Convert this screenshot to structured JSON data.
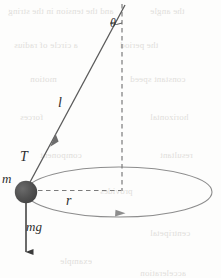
{
  "figure": {
    "background_color": "#fdfdfc",
    "ink_color": "#3a3a3a",
    "bob_color": "#4a4a4a",
    "bob_highlight_color": "#6e6e6e",
    "dash_color": "#7d7d7d",
    "ellipse_color": "#8a8a8a"
  },
  "labels": {
    "string_length": "l",
    "tension": "T",
    "mass": "m",
    "radius": "r",
    "weight": "mg",
    "angle": "θ"
  },
  "geometry": {
    "pivot": {
      "x": 125,
      "y": 4
    },
    "bob": {
      "x": 26,
      "y": 192,
      "radius": 11
    },
    "vertical_axis": {
      "x": 122,
      "y_top": 4,
      "y_bottom": 191
    },
    "orbit_ellipse": {
      "cx": 119,
      "cy": 192,
      "rx": 93,
      "ry": 25
    },
    "radius_line": {
      "x1": 37,
      "y1": 190,
      "x2": 121,
      "y2": 190
    },
    "weight_arrow": {
      "x": 26,
      "y_top": 203,
      "y_bottom": 262
    },
    "string_arrow_tip": {
      "x": 55,
      "y": 134
    },
    "orbit_arrow_tip": {
      "x": 124,
      "y": 213
    }
  },
  "ghost_text": [
    {
      "text": "and the tension in the string",
      "x": 8,
      "y": 6
    },
    {
      "text": "the angle",
      "x": 150,
      "y": 6
    },
    {
      "text": "a circle of radius",
      "x": 14,
      "y": 40
    },
    {
      "text": "the period",
      "x": 120,
      "y": 40
    },
    {
      "text": "motion",
      "x": 30,
      "y": 74
    },
    {
      "text": "constant speed",
      "x": 130,
      "y": 74
    },
    {
      "text": "forces",
      "x": 20,
      "y": 112
    },
    {
      "text": "horizontal",
      "x": 150,
      "y": 112
    },
    {
      "text": "component",
      "x": 40,
      "y": 150
    },
    {
      "text": "resultant",
      "x": 160,
      "y": 150
    },
    {
      "text": "provides",
      "x": 100,
      "y": 186
    },
    {
      "text": "centripetal",
      "x": 150,
      "y": 228
    },
    {
      "text": "example",
      "x": 60,
      "y": 256
    },
    {
      "text": "acceleration",
      "x": 140,
      "y": 268
    }
  ]
}
